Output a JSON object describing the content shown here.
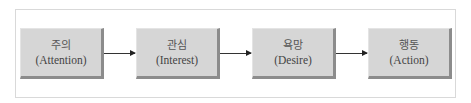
{
  "diagram": {
    "type": "flowchart",
    "direction": "left-to-right",
    "nodes": [
      {
        "id": "attention",
        "korean": "주의",
        "english": "(Attention)"
      },
      {
        "id": "interest",
        "korean": "관심",
        "english": "(Interest)"
      },
      {
        "id": "desire",
        "korean": "욕망",
        "english": "(Desire)"
      },
      {
        "id": "action",
        "korean": "행동",
        "english": "(Action)"
      }
    ],
    "edges": [
      {
        "from": "attention",
        "to": "interest"
      },
      {
        "from": "interest",
        "to": "desire"
      },
      {
        "from": "desire",
        "to": "action"
      }
    ],
    "colors": {
      "box_fill": "#d6d6d6",
      "box_shadow": "#8c8c8c",
      "arrow": "#333333",
      "frame_border": "#d9d9d9"
    }
  }
}
